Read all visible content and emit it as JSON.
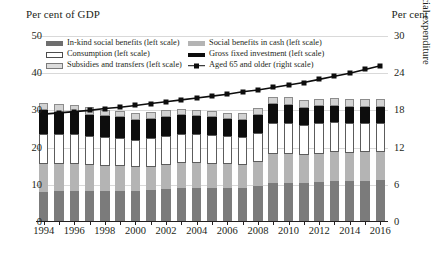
{
  "captions": {
    "left_unit": "Per cent of GDP",
    "right_unit": "Per cent",
    "right_axis_title": "Social expenditure"
  },
  "legend": {
    "items": [
      {
        "label": "In-kind social benefits (left scale)",
        "swatch": "dark-gray-fill",
        "color": "#6e6e6e"
      },
      {
        "label": "Social benefits in cash (left scale)",
        "swatch": "mid-gray-fill",
        "color": "#b4b4b4"
      },
      {
        "label": "Consumption (left scale)",
        "swatch": "white-fill-outline",
        "color": "#ffffff"
      },
      {
        "label": "Gross fixed investment (left scale)",
        "swatch": "black-fill",
        "color": "#0d0d0d"
      },
      {
        "label": "Subsidies and transfers (left scale)",
        "swatch": "light-gray-fill",
        "color": "#dcdcdc"
      },
      {
        "label": "Aged 65 and older (right scale)",
        "swatch": "line-with-square-marker",
        "color": "#0d0d0d"
      }
    ]
  },
  "chart_data": {
    "type": "bar",
    "title": "",
    "subtitle": "",
    "xlabel": "",
    "ylabel": "Per cent of GDP",
    "y2label": "Social expenditure",
    "ylim": [
      0,
      50
    ],
    "y2lim": [
      0,
      30
    ],
    "yticks": [
      0,
      10,
      20,
      30,
      40,
      50
    ],
    "y2ticks": [
      0,
      6,
      12,
      18,
      24,
      30
    ],
    "grid": true,
    "legend_position": "top-inside",
    "stacked": true,
    "categories": [
      "1994",
      "1995",
      "1996",
      "1997",
      "1998",
      "1999",
      "2000",
      "2001",
      "2002",
      "2003",
      "2004",
      "2005",
      "2006",
      "2007",
      "2008",
      "2009",
      "2010",
      "2011",
      "2012",
      "2013",
      "2014",
      "2015",
      "2016"
    ],
    "xtick_labels": [
      "1994",
      "1996",
      "1998",
      "2000",
      "2002",
      "2004",
      "2006",
      "2008",
      "2010",
      "2012",
      "2014",
      "2016"
    ],
    "series": [
      {
        "name": "In-kind social benefits (left scale)",
        "axis": "left",
        "color": "#7b7b7b",
        "values": [
          8.2,
          8.3,
          8.4,
          8.3,
          8.3,
          8.4,
          8.4,
          8.6,
          8.9,
          9.1,
          9.1,
          9.1,
          9.1,
          9.2,
          9.7,
          10.6,
          10.6,
          10.5,
          10.8,
          11.0,
          11.0,
          11.1,
          11.2
        ]
      },
      {
        "name": "Social benefits in cash (left scale)",
        "axis": "left",
        "color": "#b4b4b4",
        "values": [
          7.3,
          7.3,
          7.2,
          7.0,
          6.8,
          6.6,
          6.3,
          6.3,
          6.5,
          6.7,
          6.7,
          6.6,
          6.4,
          6.2,
          6.5,
          7.6,
          7.7,
          7.5,
          7.6,
          7.7,
          7.6,
          7.6,
          7.6
        ]
      },
      {
        "name": "Consumption (left scale)",
        "axis": "left",
        "color": "#ffffff",
        "values": [
          8.2,
          8.0,
          8.0,
          7.8,
          7.7,
          7.6,
          7.4,
          7.6,
          7.8,
          7.9,
          7.8,
          7.7,
          7.5,
          7.4,
          7.7,
          8.3,
          8.2,
          8.0,
          8.1,
          8.1,
          8.0,
          7.9,
          7.9
        ]
      },
      {
        "name": "Gross fixed investment (left scale)",
        "axis": "left",
        "color": "#0d0d0d",
        "values": [
          6.3,
          6.1,
          6.0,
          5.8,
          5.6,
          5.5,
          5.3,
          5.2,
          5.1,
          5.0,
          4.8,
          4.7,
          4.6,
          4.6,
          4.8,
          5.1,
          5.0,
          4.7,
          4.6,
          4.5,
          4.4,
          4.4,
          4.3
        ]
      },
      {
        "name": "Subsidies and transfers (left scale)",
        "axis": "left",
        "color": "#d2d2d2",
        "values": [
          1.9,
          1.9,
          1.9,
          1.9,
          1.8,
          1.8,
          1.8,
          1.8,
          1.8,
          1.8,
          1.8,
          1.8,
          1.8,
          1.8,
          1.9,
          2.1,
          2.1,
          2.0,
          2.0,
          2.0,
          2.0,
          2.0,
          2.0
        ]
      },
      {
        "name": "Aged 65 and older (right scale)",
        "axis": "right",
        "type": "line",
        "color": "#0d0d0d",
        "marker": "square",
        "values": [
          17.4,
          17.6,
          17.8,
          18.0,
          18.3,
          18.5,
          18.8,
          19.1,
          19.4,
          19.7,
          20.0,
          20.3,
          20.6,
          21.0,
          21.3,
          21.7,
          22.1,
          22.5,
          23.0,
          23.5,
          24.0,
          24.6,
          25.2
        ]
      }
    ],
    "totals": [
      31.9,
      31.6,
      31.5,
      30.8,
      30.2,
      29.9,
      29.2,
      29.5,
      30.1,
      30.5,
      30.2,
      29.9,
      29.4,
      29.2,
      30.6,
      33.7,
      33.6,
      32.7,
      33.1,
      33.3,
      33.0,
      33.0,
      33.0
    ]
  }
}
